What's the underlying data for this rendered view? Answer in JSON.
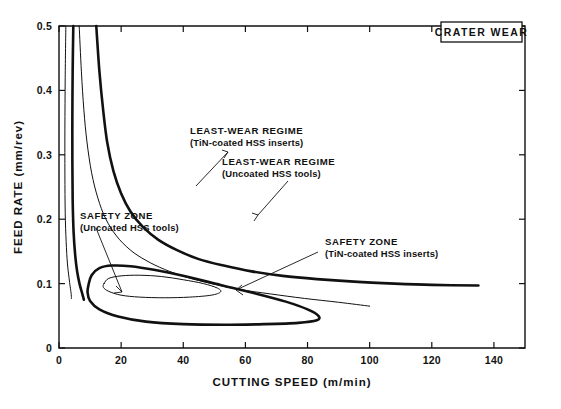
{
  "figure": {
    "title_box_label": "CRATER WEAR"
  },
  "chart_data": {
    "type": "line",
    "title": "CRATER WEAR",
    "xlabel": "CUTTING SPEED (m/min)",
    "ylabel": "FEED RATE (mm/rev)",
    "xlim": [
      0,
      150
    ],
    "ylim": [
      0,
      0.5
    ],
    "xticks": [
      0,
      20,
      40,
      60,
      80,
      100,
      120,
      140
    ],
    "xticklabels": [
      "0",
      "20",
      "40",
      "60",
      "80",
      "100",
      "120",
      "140"
    ],
    "yticks": [
      0,
      0.1,
      0.2,
      0.3,
      0.4,
      0.5
    ],
    "yticklabels": [
      "0",
      "0.1",
      "0.2",
      "0.3",
      "0.4",
      "0.5"
    ],
    "grid": false,
    "legend": "annotated-inline",
    "series": [
      {
        "name": "LEAST-WEAR REGIME (TiN-coated HSS inserts)",
        "style": "thick",
        "description": "Hyperbolic boundary opening to the right; high feed at low speed, flattening to ~0.097 mm/rev near 135 m/min",
        "points": [
          [
            12.0,
            0.5
          ],
          [
            13.0,
            0.43
          ],
          [
            14.2,
            0.37
          ],
          [
            15.5,
            0.32
          ],
          [
            17.5,
            0.275
          ],
          [
            20.0,
            0.24
          ],
          [
            23.0,
            0.212
          ],
          [
            27.0,
            0.188
          ],
          [
            32.0,
            0.168
          ],
          [
            38.0,
            0.152
          ],
          [
            45.0,
            0.138
          ],
          [
            53.0,
            0.128
          ],
          [
            62.0,
            0.119
          ],
          [
            72.0,
            0.112
          ],
          [
            83.0,
            0.107
          ],
          [
            95.0,
            0.103
          ],
          [
            108.0,
            0.1
          ],
          [
            120.0,
            0.098
          ],
          [
            135.0,
            0.097
          ]
        ]
      },
      {
        "name": "LEAST-WEAR REGIME (Uncoated HSS tools)",
        "style": "thin",
        "description": "Lower hyperbolic boundary; terminates near 100 m/min at ~0.065 mm/rev",
        "points": [
          [
            6.5,
            0.5
          ],
          [
            7.2,
            0.43
          ],
          [
            8.0,
            0.37
          ],
          [
            9.0,
            0.32
          ],
          [
            10.5,
            0.272
          ],
          [
            12.5,
            0.233
          ],
          [
            15.0,
            0.201
          ],
          [
            18.5,
            0.174
          ],
          [
            23.0,
            0.152
          ],
          [
            28.0,
            0.136
          ],
          [
            34.0,
            0.122
          ],
          [
            41.0,
            0.11
          ],
          [
            49.0,
            0.1
          ],
          [
            58.0,
            0.091
          ],
          [
            68.0,
            0.084
          ],
          [
            79.0,
            0.077
          ],
          [
            90.0,
            0.071
          ],
          [
            100.0,
            0.065
          ]
        ]
      },
      {
        "name": "Left vertical boundary (thick, coated)",
        "style": "thick",
        "description": "Near-vertical left asymptote of the thick regime, sweeping down to low feed at ~4 m/min",
        "points": [
          [
            4.6,
            0.5
          ],
          [
            4.4,
            0.43
          ],
          [
            4.3,
            0.36
          ],
          [
            4.3,
            0.29
          ],
          [
            4.4,
            0.23
          ],
          [
            4.7,
            0.18
          ],
          [
            5.2,
            0.145
          ],
          [
            5.8,
            0.12
          ],
          [
            6.6,
            0.1
          ],
          [
            7.4,
            0.086
          ],
          [
            8.0,
            0.075
          ]
        ]
      },
      {
        "name": "Left vertical boundary (thin, uncoated)",
        "style": "thin",
        "description": "Near-vertical left asymptote of the thin regime",
        "points": [
          [
            2.2,
            0.5
          ],
          [
            2.0,
            0.42
          ],
          [
            1.9,
            0.34
          ],
          [
            1.9,
            0.27
          ],
          [
            2.0,
            0.21
          ],
          [
            2.3,
            0.165
          ],
          [
            2.7,
            0.132
          ],
          [
            3.2,
            0.11
          ],
          [
            3.6,
            0.095
          ],
          [
            3.9,
            0.085
          ],
          [
            4.0,
            0.077
          ]
        ]
      },
      {
        "name": "SAFETY ZONE (Uncoated HSS tools)",
        "style": "thick",
        "description": "Large closed loop, approx 9-84 m/min and 0.040-0.128 mm/rev",
        "closed": true,
        "points": [
          [
            9.5,
            0.098
          ],
          [
            10.5,
            0.113
          ],
          [
            13.0,
            0.124
          ],
          [
            17.0,
            0.128
          ],
          [
            23.0,
            0.127
          ],
          [
            31.0,
            0.121
          ],
          [
            41.0,
            0.111
          ],
          [
            52.0,
            0.098
          ],
          [
            63.0,
            0.085
          ],
          [
            73.0,
            0.072
          ],
          [
            80.0,
            0.06
          ],
          [
            83.5,
            0.05
          ],
          [
            83.0,
            0.043
          ],
          [
            77.0,
            0.039
          ],
          [
            66.0,
            0.037
          ],
          [
            53.0,
            0.036
          ],
          [
            40.0,
            0.037
          ],
          [
            28.0,
            0.041
          ],
          [
            19.0,
            0.049
          ],
          [
            13.0,
            0.06
          ],
          [
            10.0,
            0.073
          ],
          [
            9.2,
            0.086
          ]
        ]
      },
      {
        "name": "SAFETY ZONE (TiN-coated HSS inserts)",
        "style": "thin",
        "description": "Smaller inner closed loop, approx 14-52 m/min and 0.078-0.113 mm/rev",
        "closed": true,
        "points": [
          [
            14.5,
            0.1
          ],
          [
            16.0,
            0.108
          ],
          [
            20.0,
            0.112
          ],
          [
            26.0,
            0.113
          ],
          [
            33.0,
            0.111
          ],
          [
            40.0,
            0.106
          ],
          [
            46.5,
            0.1
          ],
          [
            51.0,
            0.093
          ],
          [
            52.0,
            0.087
          ],
          [
            49.0,
            0.082
          ],
          [
            42.0,
            0.079
          ],
          [
            34.0,
            0.078
          ],
          [
            26.0,
            0.079
          ],
          [
            20.0,
            0.082
          ],
          [
            16.0,
            0.088
          ],
          [
            14.3,
            0.094
          ]
        ]
      }
    ],
    "annotations": [
      {
        "id": "least-wear-coated",
        "line1": "LEAST-WEAR REGIME",
        "line2": "(TiN-coated HSS inserts)",
        "points_to": "thick least-wear regime curve"
      },
      {
        "id": "least-wear-uncoated",
        "line1": "LEAST-WEAR REGIME",
        "line2": "(Uncoated HSS tools)",
        "points_to": "thin least-wear regime curve"
      },
      {
        "id": "safety-zone-uncoated",
        "line1": "SAFETY ZONE",
        "line2": "(Uncoated HSS tools)",
        "points_to": "large thick closed loop"
      },
      {
        "id": "safety-zone-coated",
        "line1": "SAFETY ZONE",
        "line2": "(TiN-coated HSS inserts)",
        "points_to": "small thin closed loop"
      }
    ]
  }
}
